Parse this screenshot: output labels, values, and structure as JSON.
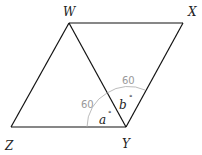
{
  "diagram": {
    "vertices": {
      "W": {
        "label": "W",
        "x": 69,
        "y": 23
      },
      "X": {
        "label": "X",
        "x": 183,
        "y": 23
      },
      "Y": {
        "label": "Y",
        "x": 126,
        "y": 127
      },
      "Z": {
        "label": "Z",
        "x": 11,
        "y": 127
      }
    },
    "angles": {
      "a": {
        "label": "a",
        "degree_symbol": "°",
        "annotation": "60"
      },
      "b": {
        "label": "b",
        "degree_symbol": "°",
        "annotation": "60"
      }
    },
    "colors": {
      "lines": "#111111",
      "annotation": "#999999"
    }
  }
}
